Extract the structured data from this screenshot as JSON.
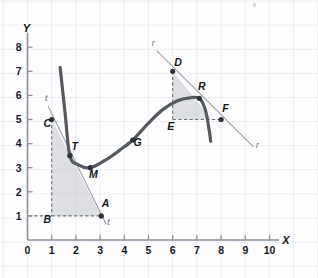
{
  "chart_data": {
    "type": "line",
    "title": "",
    "xlabel": "X",
    "ylabel": "Y",
    "xlim": [
      0,
      10.4
    ],
    "ylim": [
      0,
      8.6
    ],
    "grid": true,
    "grid_color": "#d2d7e4",
    "axis_color": "#8a8f99",
    "curve_color": "#555a60",
    "shade_color": "#c9ccd1",
    "x_ticks": [
      "0",
      "1",
      "2",
      "3",
      "4",
      "5",
      "6",
      "7",
      "8",
      "9",
      "10"
    ],
    "y_ticks": [
      "1",
      "2",
      "3",
      "4",
      "5",
      "6",
      "7",
      "8"
    ],
    "series": [
      {
        "name": "f",
        "type": "curve",
        "points": [
          [
            1.35,
            7.15
          ],
          [
            1.55,
            5.3
          ],
          [
            1.75,
            3.5
          ],
          [
            2.1,
            3.12
          ],
          [
            2.6,
            3.0
          ],
          [
            3.2,
            3.3
          ],
          [
            3.8,
            3.72
          ],
          [
            4.35,
            4.15
          ],
          [
            5.0,
            4.85
          ],
          [
            5.6,
            5.42
          ],
          [
            6.2,
            5.78
          ],
          [
            6.7,
            5.9
          ],
          [
            7.1,
            5.88
          ],
          [
            7.35,
            5.4
          ],
          [
            7.5,
            4.6
          ],
          [
            7.57,
            4.1
          ]
        ]
      }
    ],
    "tangent_lines": [
      {
        "name": "t",
        "label": "t",
        "through": [
          [
            0.85,
            5.55
          ],
          [
            3.25,
            0.65
          ]
        ],
        "tangent_point": "T",
        "label_positions": [
          [
            0.78,
            5.75
          ],
          [
            3.35,
            0.62
          ]
        ]
      },
      {
        "name": "r",
        "label": "r",
        "through": [
          [
            5.35,
            7.85
          ],
          [
            9.35,
            3.85
          ]
        ],
        "tangent_point": "R",
        "label_positions": [
          [
            5.2,
            8.05
          ],
          [
            9.5,
            3.8
          ]
        ]
      }
    ],
    "labeled_points": [
      {
        "label": "A",
        "x": 3.05,
        "y": 1.0,
        "dot": true,
        "lx": 3.22,
        "ly": 1.35
      },
      {
        "label": "B",
        "x": 1.0,
        "y": 1.0,
        "dot": false,
        "lx": 0.82,
        "ly": 0.72
      },
      {
        "label": "C",
        "x": 1.0,
        "y": 5.0,
        "dot": true,
        "lx": 0.82,
        "ly": 4.68
      },
      {
        "label": "D",
        "x": 6.0,
        "y": 7.0,
        "dot": true,
        "lx": 6.22,
        "ly": 7.22
      },
      {
        "label": "E",
        "x": 6.0,
        "y": 5.0,
        "dot": false,
        "lx": 5.92,
        "ly": 4.58
      },
      {
        "label": "F",
        "x": 8.0,
        "y": 5.0,
        "dot": true,
        "lx": 8.18,
        "ly": 5.3
      },
      {
        "label": "G",
        "x": 4.35,
        "y": 4.15,
        "dot": true,
        "lx": 4.55,
        "ly": 3.92
      },
      {
        "label": "M",
        "x": 2.6,
        "y": 3.0,
        "dot": true,
        "lx": 2.72,
        "ly": 2.58
      },
      {
        "label": "R",
        "x": 7.1,
        "y": 5.88,
        "dot": true,
        "lx": 7.2,
        "ly": 6.22
      },
      {
        "label": "T",
        "x": 1.75,
        "y": 3.5,
        "dot": true,
        "lx": 1.95,
        "ly": 3.72
      }
    ],
    "shaded_regions": [
      {
        "name": "triangle-CBA",
        "vertices": [
          [
            1,
            5
          ],
          [
            1,
            1
          ],
          [
            3.05,
            1
          ]
        ]
      },
      {
        "name": "triangle-DER",
        "vertices": [
          [
            6,
            7
          ],
          [
            6,
            5
          ],
          [
            7.62,
            5
          ]
        ]
      }
    ],
    "dashed_segments": [
      {
        "name": "C-to-B",
        "from": [
          1,
          5
        ],
        "to": [
          1,
          1
        ]
      },
      {
        "name": "B-to-A",
        "from": [
          1,
          1
        ],
        "to": [
          3.05,
          1
        ]
      },
      {
        "name": "y1-to-B",
        "from": [
          0.05,
          1
        ],
        "to": [
          1,
          1
        ]
      },
      {
        "name": "D-to-E",
        "from": [
          6,
          7
        ],
        "to": [
          6,
          5
        ]
      },
      {
        "name": "E-to-F",
        "from": [
          6,
          5
        ],
        "to": [
          8,
          5
        ]
      }
    ]
  },
  "axes": {
    "x_axis_label": "X",
    "y_axis_label": "Y"
  }
}
